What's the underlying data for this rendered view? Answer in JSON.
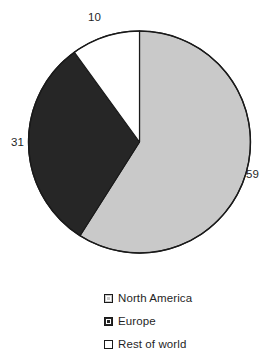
{
  "chart_data": {
    "type": "pie",
    "title": "",
    "subtitle": "",
    "xlabel": "",
    "ylabel": "",
    "categories": [
      "North America",
      "Europe",
      "Rest of world"
    ],
    "values": [
      59,
      31,
      10
    ],
    "slice_colors": [
      "#c9c9c9",
      "#262626",
      "#ffffff"
    ],
    "slice_border_color": "#1a1a1a",
    "start_angle_deg": 0,
    "direction": "clockwise",
    "grid": false,
    "legend_position": "bottom",
    "data_labels": [
      "59",
      "31",
      "10"
    ],
    "slices": [
      {
        "label": "North America",
        "value": 59,
        "display": "59",
        "color": "#c9c9c9"
      },
      {
        "label": "Europe",
        "value": 31,
        "display": "31",
        "color": "#262626"
      },
      {
        "label": "Rest of world",
        "value": 10,
        "display": "10",
        "color": "#ffffff"
      }
    ]
  },
  "labels": {
    "north_america": "59",
    "europe": "31",
    "rest_of_world": "10"
  },
  "legend": {
    "items": [
      {
        "label": "North America",
        "color": "#c9c9c9"
      },
      {
        "label": "Europe",
        "color": "#262626"
      },
      {
        "label": "Rest of world",
        "color": "#ffffff"
      }
    ]
  },
  "colors": {
    "north_america": "#c9c9c9",
    "europe": "#262626",
    "rest_of_world": "#ffffff",
    "outline": "#1a1a1a",
    "background": "#ffffff",
    "text": "#1f1f1f"
  }
}
